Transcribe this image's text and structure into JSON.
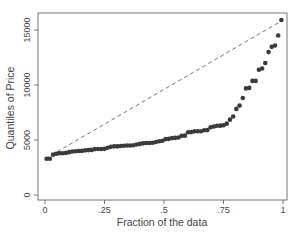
{
  "chart_data": {
    "type": "scatter",
    "title": "",
    "xlabel": "Fraction of the data",
    "ylabel": "Quantiles of Price",
    "xlim": [
      0,
      1
    ],
    "ylim": [
      0,
      16000
    ],
    "x_ticks": [
      "0",
      ".25",
      ".5",
      ".75",
      "1"
    ],
    "y_ticks": [
      "0",
      "5000",
      "10000",
      "15000"
    ],
    "reference_line": {
      "from": [
        0,
        3291
      ],
      "to": [
        1,
        15906
      ],
      "style": "dashed"
    },
    "grid": false,
    "values": [
      3291,
      3299,
      3667,
      3748,
      3798,
      3799,
      3829,
      3895,
      3955,
      3984,
      3995,
      4010,
      4060,
      4082,
      4099,
      4172,
      4181,
      4187,
      4195,
      4296,
      4389,
      4424,
      4425,
      4453,
      4482,
      4499,
      4504,
      4516,
      4589,
      4647,
      4697,
      4723,
      4733,
      4749,
      4816,
      4890,
      4934,
      5079,
      5104,
      5172,
      5189,
      5222,
      5379,
      5397,
      5705,
      5719,
      5788,
      5798,
      5799,
      5886,
      5899,
      6165,
      6229,
      6295,
      6303,
      6342,
      6486,
      6850,
      7140,
      7827,
      8129,
      8814,
      9690,
      9735,
      10371,
      10372,
      11385,
      11497,
      11995,
      12990,
      13466,
      13594,
      14500,
      15906
    ]
  }
}
